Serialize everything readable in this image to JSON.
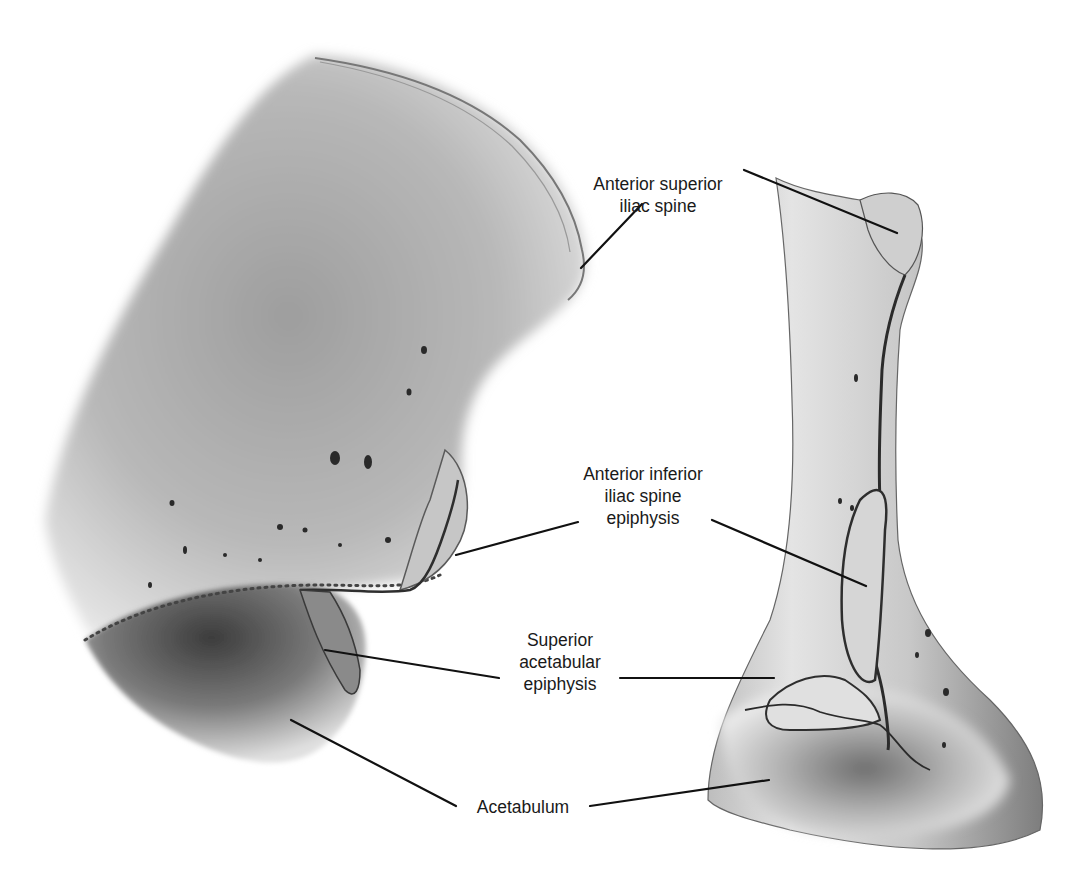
{
  "figure": {
    "views": [
      {
        "name": "left-view",
        "description": "Ilium lateral oblique view"
      },
      {
        "name": "right-view",
        "description": "Ilium anterior view"
      }
    ],
    "labels": {
      "asis": {
        "lines": [
          "Anterior superior",
          "iliac spine"
        ]
      },
      "aiis": {
        "lines": [
          "Anterior inferior",
          "iliac spine",
          "epiphysis"
        ]
      },
      "sae": {
        "lines": [
          "Superior",
          "acetabular",
          "epiphysis"
        ]
      },
      "acetabulum": {
        "lines": [
          "Acetabulum"
        ]
      }
    },
    "colors": {
      "background": "#ffffff",
      "bone_light": "#d9d9d9",
      "bone_mid": "#a8a8a8",
      "bone_dark": "#3a3a3a",
      "leader_line": "#111111",
      "text": "#1a1a1a"
    }
  }
}
